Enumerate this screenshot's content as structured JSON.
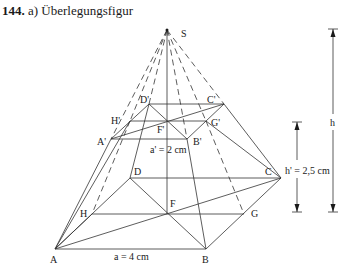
{
  "heading": {
    "number": "144.",
    "text": "a)  Überlegungsfigur"
  },
  "diagram": {
    "type": "truncated-pyramid-construction",
    "points": {
      "S": "S",
      "A": "A",
      "B": "B",
      "C": "C",
      "D": "D",
      "F": "F",
      "G": "G",
      "H": "H",
      "A_prime": "A'",
      "B_prime": "B'",
      "C_prime": "C'",
      "D_prime": "D'",
      "F_prime": "F'",
      "G_prime": "G'",
      "H_prime": "H'"
    },
    "labels": {
      "base_edge": "a = 4 cm",
      "top_edge": "a' = 2 cm",
      "frustum_height": "h' = 2,5 cm",
      "total_height": "h"
    }
  }
}
